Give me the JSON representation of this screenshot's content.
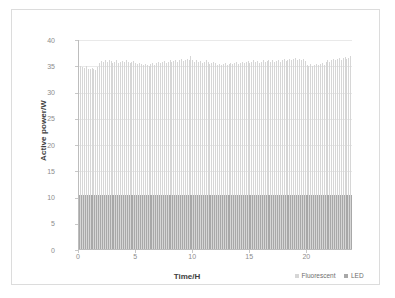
{
  "chart_data": {
    "type": "bar",
    "title": "",
    "xlabel": "Time/H",
    "ylabel": "Active power/W",
    "xlim": [
      0,
      24
    ],
    "ylim": [
      0,
      40
    ],
    "ytick_values": [
      0,
      5,
      10,
      15,
      20,
      25,
      30,
      35,
      40
    ],
    "ytick_labels": [
      "0",
      "5",
      "10",
      "15",
      "20",
      "25",
      "30",
      "35",
      "40"
    ],
    "xtick_values": [
      0,
      5,
      10,
      15,
      20
    ],
    "xtick_labels": [
      "0",
      "5",
      "10",
      "15",
      "20"
    ],
    "grid": true,
    "grid_axis": "y",
    "legend_position": "bottom-right",
    "bar_width_ratio": 0.55,
    "colors": {
      "fluorescent": "#d6d6d6",
      "led": "#a8a8a8",
      "gridline": "#e9e9e9",
      "axis": "#bdbdbd",
      "tick_text": "#8c8c8c",
      "axis_title": "#404040",
      "frame": "#dcdcdc",
      "background": "#ffffff"
    },
    "series": [
      {
        "name": "Fluorescent",
        "color": "#d6d6d6",
        "values": [
          36.2,
          35.1,
          34.8,
          34.6,
          35.0,
          34.5,
          34.4,
          34.6,
          34.5,
          34.3,
          34.9,
          35.6,
          36.0,
          35.8,
          36.1,
          35.9,
          36.2,
          36.0,
          35.6,
          35.9,
          36.1,
          35.7,
          35.9,
          36.0,
          35.8,
          36.1,
          35.9,
          35.6,
          35.8,
          36.0,
          35.7,
          35.4,
          35.6,
          35.5,
          35.2,
          35.4,
          35.3,
          35.1,
          35.5,
          35.6,
          35.3,
          35.7,
          35.9,
          35.6,
          35.8,
          36.0,
          35.7,
          35.9,
          36.1,
          35.8,
          36.0,
          36.2,
          35.9,
          36.1,
          36.3,
          36.0,
          36.2,
          36.4,
          36.1,
          36.9,
          36.2,
          35.9,
          36.1,
          35.8,
          36.0,
          35.7,
          35.9,
          36.1,
          35.8,
          35.5,
          35.7,
          35.9,
          35.6,
          35.3,
          35.5,
          35.2,
          35.4,
          35.6,
          35.3,
          35.5,
          35.7,
          35.4,
          35.6,
          35.8,
          35.5,
          35.7,
          35.9,
          35.6,
          35.8,
          36.0,
          35.7,
          35.9,
          36.1,
          35.8,
          36.0,
          35.7,
          35.9,
          36.1,
          35.8,
          36.0,
          36.2,
          35.9,
          36.1,
          35.8,
          36.0,
          36.2,
          35.9,
          36.1,
          36.3,
          36.0,
          36.2,
          36.4,
          36.1,
          36.3,
          36.5,
          36.2,
          36.4,
          36.1,
          36.3,
          36.0,
          35.2,
          35.0,
          35.4,
          35.1,
          35.3,
          35.5,
          35.2,
          35.4,
          35.6,
          35.3,
          35.8,
          36.1,
          35.9,
          36.2,
          36.4,
          36.1,
          36.3,
          36.5,
          36.2,
          36.6,
          36.8,
          36.4,
          36.6,
          36.9
        ],
        "n_points": 144,
        "approx_range": [
          34.3,
          36.9
        ],
        "approx_mean": 35.8
      },
      {
        "name": "LED",
        "color": "#a8a8a8",
        "values": [
          10.5,
          10.4,
          10.5,
          10.4,
          10.5,
          10.5,
          10.4,
          10.5,
          10.4,
          10.5,
          10.5,
          10.4,
          10.5,
          10.5,
          10.4,
          10.5,
          10.5,
          10.4,
          10.5,
          10.4,
          10.5,
          10.5,
          10.4,
          10.5,
          10.5,
          10.4,
          10.5,
          10.4,
          10.5,
          10.5,
          10.4,
          10.5,
          10.5,
          10.4,
          10.5,
          10.4,
          10.5,
          10.5,
          10.4,
          10.5,
          10.5,
          10.4,
          10.5,
          10.4,
          10.5,
          10.5,
          10.4,
          10.5,
          10.5,
          10.4,
          10.5,
          10.4,
          10.5,
          10.5,
          10.4,
          10.5,
          10.5,
          10.4,
          10.5,
          10.4,
          10.5,
          10.5,
          10.4,
          10.5,
          10.5,
          10.4,
          10.5,
          10.4,
          10.5,
          10.5,
          10.4,
          10.5,
          10.5,
          10.4,
          10.5,
          10.4,
          10.5,
          10.5,
          10.4,
          10.5,
          10.5,
          10.4,
          10.5,
          10.4,
          10.5,
          10.5,
          10.4,
          10.5,
          10.5,
          10.4,
          10.5,
          10.4,
          10.5,
          10.5,
          10.4,
          10.5,
          10.5,
          10.4,
          10.5,
          10.4,
          10.5,
          10.5,
          10.4,
          10.5,
          10.5,
          10.4,
          10.5,
          10.4,
          10.5,
          10.5,
          10.4,
          10.5,
          10.5,
          10.4,
          10.5,
          10.4,
          10.5,
          10.5,
          10.4,
          10.5,
          10.5,
          10.4,
          10.5,
          10.4,
          10.5,
          10.5,
          10.4,
          10.5,
          10.5,
          10.4,
          10.5,
          10.4,
          10.5,
          10.5,
          10.4,
          10.5,
          10.5,
          10.4,
          10.5,
          10.4,
          10.5,
          10.5,
          10.4,
          10.5
        ],
        "n_points": 144,
        "approx_range": [
          10.4,
          10.5
        ],
        "approx_mean": 10.45
      }
    ],
    "legend": [
      {
        "label": "Fluorescent",
        "color": "#d6d6d6"
      },
      {
        "label": "LED",
        "color": "#a8a8a8"
      }
    ]
  }
}
